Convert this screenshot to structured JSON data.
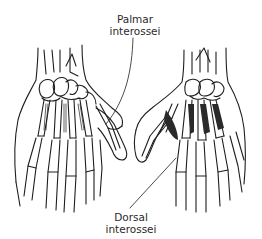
{
  "figure": {
    "views": [
      {
        "name": "palmar-view",
        "side": "left"
      },
      {
        "name": "dorsal-view",
        "side": "right"
      }
    ],
    "line_color": "#1e1e1e",
    "background": "#ffffff"
  },
  "labels": {
    "palmar": {
      "line1": "Palmar",
      "line2": "interossei"
    },
    "dorsal": {
      "line1": "Dorsal",
      "line2": "interossei"
    }
  }
}
